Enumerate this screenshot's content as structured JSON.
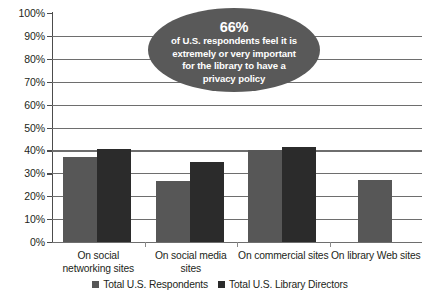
{
  "chart_data": {
    "type": "bar",
    "title": "",
    "subtitle": "",
    "xlabel": "",
    "ylabel": "",
    "ylim": [
      0,
      100
    ],
    "ytick_labels": [
      "100%",
      "90%",
      "80%",
      "70%",
      "60%",
      "50%",
      "40%",
      "30%",
      "20%",
      "10%",
      "0%"
    ],
    "ytick_values": [
      100,
      90,
      80,
      70,
      60,
      50,
      40,
      30,
      20,
      10,
      0
    ],
    "grid": true,
    "grid_axis": "y",
    "legend_position": "bottom",
    "categories": [
      "On social networking sites",
      "On social media sites",
      "On commercial sites",
      "On library Web sites"
    ],
    "series": [
      {
        "name": "Total U.S. Respondents",
        "color": "#575757",
        "values": [
          37,
          26.5,
          40,
          27
        ]
      },
      {
        "name": "Total U.S. Library Directors",
        "color": "#2b2b2b",
        "values": [
          40.5,
          35,
          41.5,
          null
        ]
      }
    ],
    "annotations": [
      {
        "name": "privacy-policy-callout",
        "shape": "ellipse",
        "fill": "#595959",
        "text_color": "#ffffff",
        "headline": "66%",
        "lines": [
          "of U.S. respondents feel it is",
          "extremely or very important",
          "for the library to have a",
          "privacy policy"
        ]
      }
    ]
  }
}
